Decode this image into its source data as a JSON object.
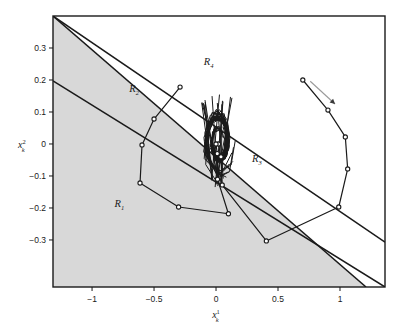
{
  "figure": {
    "background_color": "#ffffff",
    "plot_frame_color": "#1a1a1a",
    "shaded_region_color": "#d8d8d8",
    "trajectory_color": "#1a1a1a",
    "arrow_color": "#9a9a9a"
  },
  "axes": {
    "xlabel_base": "x",
    "xlabel_sub": "k",
    "xlabel_sup": "1",
    "ylabel_base": "x",
    "ylabel_sub": "k",
    "ylabel_sup": "2",
    "x_ticks": [
      "-1",
      "-0.5",
      "0",
      "0.5",
      "1"
    ],
    "x_tick_values": [
      -1,
      -0.5,
      0,
      0.5,
      1
    ],
    "y_ticks": [
      "0.3",
      "0.2",
      "0.1",
      "0",
      "-0.1",
      "-0.2",
      "-0.3"
    ],
    "y_tick_values": [
      0.3,
      0.2,
      0.1,
      0,
      -0.1,
      -0.2,
      -0.3
    ],
    "xlim": [
      -1.315,
      1.363
    ],
    "ylim": [
      -0.447,
      0.4
    ],
    "grid": false
  },
  "region_labels": [
    {
      "base": "R",
      "sub": "1",
      "x": -0.78,
      "y": -0.197
    },
    {
      "base": "R",
      "sub": "2",
      "x": -0.66,
      "y": 0.162
    },
    {
      "base": "R",
      "sub": "3",
      "x": 0.33,
      "y": -0.056
    },
    {
      "base": "R",
      "sub": "4",
      "x": -0.06,
      "y": 0.247
    }
  ],
  "chart_data": {
    "type": "line",
    "title": "",
    "xlabel": "x_k^1",
    "ylabel": "x_k^2",
    "xlim": [
      -1.315,
      1.363
    ],
    "ylim": [
      -0.447,
      0.4
    ],
    "grid": false,
    "legend": null,
    "partition_lines": [
      {
        "name": "boundary-upper",
        "comment": "separates R_2/R_4 upper edge, slope negative",
        "points": [
          [
            -1.315,
            0.4
          ],
          [
            1.363,
            -0.307
          ]
        ]
      },
      {
        "name": "boundary-middle",
        "comment": "separates R_2 from R_1, passes near y=0.2 at left edge",
        "points": [
          [
            -1.315,
            0.197
          ],
          [
            1.363,
            -0.447
          ]
        ]
      },
      {
        "name": "boundary-lower",
        "comment": "separates R_3 from R_1 / lower right edge of shaded set",
        "points": [
          [
            -1.315,
            0.4
          ],
          [
            1.21,
            -0.447
          ]
        ]
      }
    ],
    "shaded_region": {
      "name": "R_1",
      "fill": "#d8d8d8",
      "polygon": [
        [
          -1.315,
          0.4
        ],
        [
          1.21,
          -0.447
        ],
        [
          -1.315,
          -0.447
        ]
      ]
    },
    "series": [
      {
        "name": "trajectory-A",
        "marker": "open-circle",
        "points": [
          [
            0.7,
            0.2
          ],
          [
            0.903,
            0.106
          ],
          [
            1.043,
            0.022
          ],
          [
            1.062,
            -0.078
          ],
          [
            0.99,
            -0.197
          ],
          [
            0.406,
            -0.303
          ],
          [
            0.05,
            -0.128
          ],
          [
            0.04,
            -0.04
          ],
          [
            0.02,
            0.0
          ]
        ]
      },
      {
        "name": "trajectory-B",
        "marker": "open-circle",
        "points": [
          [
            -0.29,
            0.178
          ],
          [
            -0.5,
            0.078
          ],
          [
            -0.597,
            -0.003
          ],
          [
            -0.613,
            -0.122
          ],
          [
            -0.302,
            -0.197
          ],
          [
            0.1,
            -0.218
          ],
          [
            0.012,
            -0.11
          ],
          [
            0.01,
            -0.03
          ],
          [
            0.0,
            0.0
          ]
        ]
      }
    ],
    "converging_bundle": {
      "name": "origin-cluster",
      "comment": "dense bundle of many closed-loop trajectory segments oscillating around the origin",
      "center": [
        0.02,
        0.01
      ],
      "x_extent": [
        -0.12,
        0.18
      ],
      "y_extent": [
        -0.11,
        0.145
      ],
      "line_count": 34
    },
    "annotation_arrow": {
      "name": "initial-condition-arrow",
      "from": [
        0.76,
        0.196
      ],
      "to": [
        0.96,
        0.125
      ],
      "color": "#9a9a9a"
    }
  }
}
